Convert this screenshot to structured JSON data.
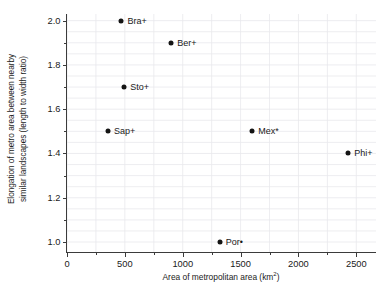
{
  "chart_data": {
    "type": "scatter",
    "title": "",
    "xlabel": "Area of metropolitan area (km",
    "xlabel_sup": "2",
    "xlabel_tail": ")",
    "ylabel_line1": "Elongation of metro area between nearby",
    "ylabel_line2": "similar landscapes (length to width ratio)",
    "xlim": [
      0,
      2670
    ],
    "ylim": [
      0.955,
      2.03
    ],
    "xticks": [
      0,
      500,
      1000,
      1500,
      2000,
      2500
    ],
    "xtick_labels": [
      "0",
      "500",
      "1000",
      "1500",
      "2000",
      "2500"
    ],
    "xticks_minor": [
      250,
      750,
      1250,
      1750,
      2250
    ],
    "yticks": [
      1.0,
      1.2,
      1.4,
      1.6,
      1.8,
      2.0
    ],
    "ytick_labels": [
      "1.0",
      "1.2",
      "1.4",
      "1.6",
      "1.8",
      "2.0"
    ],
    "yticks_minor": [
      1.1,
      1.3,
      1.5,
      1.7,
      1.9
    ],
    "grid": true,
    "grid_color": "#e9e9ec",
    "marker_color": "#141414",
    "axis_color": "#3b3b3b",
    "legend": "none",
    "points": [
      {
        "label": "Bra+",
        "x": 470,
        "y": 2.0
      },
      {
        "label": "Ber+",
        "x": 900,
        "y": 1.9
      },
      {
        "label": "Sto+",
        "x": 495,
        "y": 1.7
      },
      {
        "label": "Sap+",
        "x": 355,
        "y": 1.5
      },
      {
        "label": "Mex*",
        "x": 1600,
        "y": 1.5
      },
      {
        "label": "Phi+",
        "x": 2430,
        "y": 1.4
      },
      {
        "label": "Por•",
        "x": 1320,
        "y": 1.0
      }
    ]
  }
}
